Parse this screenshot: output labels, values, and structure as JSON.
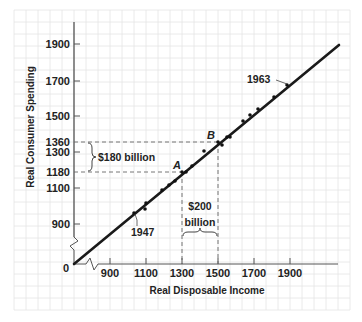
{
  "chart_data": {
    "type": "scatter",
    "title": "",
    "xlabel": "Real Disposable Income",
    "ylabel": "Real Consumer Spending",
    "x_ticks": [
      900,
      1100,
      1300,
      1500,
      1700,
      1900
    ],
    "y_ticks": [
      900,
      1100,
      1180,
      1300,
      1360,
      1500,
      1700,
      1900
    ],
    "origin_label": "0",
    "axis_breaks": true,
    "grid": true,
    "series": [
      {
        "name": "Annual observations 1947-1963",
        "type": "scatter",
        "points": [
          {
            "x": 1030,
            "y": 975
          },
          {
            "x": 1090,
            "y": 1030
          },
          {
            "x": 1090,
            "y": 995
          },
          {
            "x": 1180,
            "y": 1090
          },
          {
            "x": 1220,
            "y": 1115
          },
          {
            "x": 1250,
            "y": 1135
          },
          {
            "x": 1300,
            "y": 1180
          },
          {
            "x": 1320,
            "y": 1190
          },
          {
            "x": 1350,
            "y": 1210
          },
          {
            "x": 1420,
            "y": 1300
          },
          {
            "x": 1500,
            "y": 1360
          },
          {
            "x": 1520,
            "y": 1350
          },
          {
            "x": 1540,
            "y": 1375
          },
          {
            "x": 1560,
            "y": 1375
          },
          {
            "x": 1640,
            "y": 1480
          },
          {
            "x": 1680,
            "y": 1500
          },
          {
            "x": 1720,
            "y": 1540
          },
          {
            "x": 1800,
            "y": 1610
          },
          {
            "x": 1880,
            "y": 1680
          }
        ]
      },
      {
        "name": "Consumption function",
        "type": "line",
        "points": [
          {
            "x": 700,
            "y": 700
          },
          {
            "x": 2160,
            "y": 1980
          }
        ]
      }
    ],
    "annotations": [
      {
        "label": "A",
        "x": 1300,
        "y": 1180
      },
      {
        "label": "B",
        "x": 1500,
        "y": 1360
      },
      {
        "label": "1947",
        "x": 1030,
        "y": 975
      },
      {
        "label": "1963",
        "x": 1880,
        "y": 1680
      },
      {
        "label": "$180 billion",
        "spans_y": [
          1180,
          1360
        ]
      },
      {
        "label": "$200 billion",
        "spans_x": [
          1300,
          1500
        ]
      }
    ]
  },
  "labels": {
    "xlabel": "Real Disposable Income",
    "ylabel": "Real Consumer Spending",
    "origin": "0",
    "x_ticks": [
      "900",
      "1100",
      "1300",
      "1500",
      "1700",
      "1900"
    ],
    "y_ticks": [
      "1900",
      "1700",
      "1500",
      "1360",
      "1300",
      "1180",
      "1100",
      "900"
    ],
    "point_a": "A",
    "point_b": "B",
    "year_start": "1947",
    "year_end": "1963",
    "delta_c": "$180 billion",
    "delta_y_line1": "$200",
    "delta_y_line2": "billion"
  },
  "colors": {
    "grid": "#e3e3e3",
    "axis": "#555555",
    "line": "#1a1a1a",
    "text": "#222222"
  }
}
